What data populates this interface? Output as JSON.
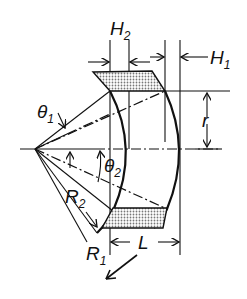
{
  "diagram": {
    "type": "technical drawing",
    "labels": {
      "H2": {
        "main": "H",
        "sub": "2"
      },
      "H1": {
        "main": "H",
        "sub": "1"
      },
      "theta1": {
        "main": "θ",
        "sub": "1"
      },
      "theta2": {
        "main": "θ",
        "sub": "2"
      },
      "R2": {
        "main": "R",
        "sub": "2"
      },
      "R1": {
        "main": "R",
        "sub": "1"
      },
      "r": {
        "main": "r"
      },
      "L": {
        "main": "L"
      }
    },
    "colors": {
      "line": "#111111",
      "background": "#ffffff",
      "shading": "#888888"
    }
  }
}
